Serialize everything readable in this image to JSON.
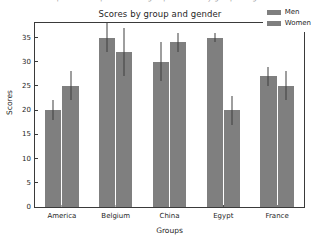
{
  "top_sliver_text": "matplotlib example  bar chart grouped  scores by group and gender",
  "chart_data": {
    "type": "bar",
    "title": "Scores by group and gender",
    "xlabel": "Groups",
    "ylabel": "Scores",
    "categories": [
      "America",
      "Belgium",
      "China",
      "Egypt",
      "France"
    ],
    "series": [
      {
        "name": "Men",
        "color": "#7f7f7f",
        "values": [
          20,
          35,
          30,
          35,
          27
        ],
        "errors": [
          2,
          3,
          4,
          1,
          2
        ]
      },
      {
        "name": "Women",
        "color": "#7f7f7f",
        "values": [
          25,
          32,
          34,
          20,
          25
        ],
        "errors": [
          3,
          5,
          2,
          3,
          3
        ]
      }
    ],
    "ylim": [
      0,
      38
    ],
    "yticks": [
      0,
      5,
      10,
      15,
      20,
      25,
      30,
      35
    ],
    "grid": false,
    "legend_position": "upper right",
    "bar_color": "#7f7f7f",
    "error_bar_color": "#3f3f3f",
    "frame_color": "#3a3a3a",
    "background": "#ffffff"
  }
}
